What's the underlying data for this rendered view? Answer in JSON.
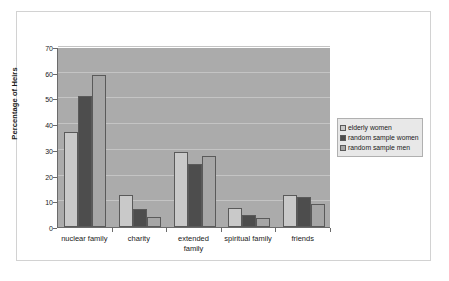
{
  "figure": {
    "background_color": "#ffffff",
    "frame_color": "#d2d2d2",
    "plot_background_color": "#ababab",
    "gridline_color": "#c4c4c4",
    "axis_color": "#6b6b6b"
  },
  "chart_data": {
    "type": "bar",
    "title": "",
    "xlabel": "",
    "ylabel": "Percentage of Heirs",
    "ylim": [
      0,
      70
    ],
    "yticks": [
      0,
      10,
      20,
      30,
      40,
      50,
      60,
      70
    ],
    "ytick_labels": [
      "0",
      "10",
      "20",
      "30",
      "40",
      "50",
      "60",
      "70"
    ],
    "grid": true,
    "legend_position": "right",
    "categories": [
      "nuclear family",
      "charity",
      "extended family",
      "spiritual family",
      "friends"
    ],
    "category_lines": [
      [
        "nuclear family"
      ],
      [
        "charity"
      ],
      [
        "extended",
        "family"
      ],
      [
        "spiritual family"
      ],
      [
        "friends"
      ]
    ],
    "series": [
      {
        "name": "elderly women",
        "color": "#c9c9c9",
        "values": [
          37,
          12.5,
          29,
          7.5,
          12.5
        ]
      },
      {
        "name": "random sample women",
        "color": "#4d4d4d",
        "values": [
          51,
          7,
          24.5,
          4.5,
          11.5
        ]
      },
      {
        "name": "random sample men",
        "color": "#a6a6a6",
        "values": [
          59,
          4,
          27.5,
          3.5,
          9
        ]
      }
    ]
  },
  "legend": {
    "items": [
      {
        "label": "elderly women",
        "color": "#c9c9c9"
      },
      {
        "label": "random sample women",
        "color": "#4d4d4d"
      },
      {
        "label": "random sample men",
        "color": "#a6a6a6"
      }
    ]
  }
}
